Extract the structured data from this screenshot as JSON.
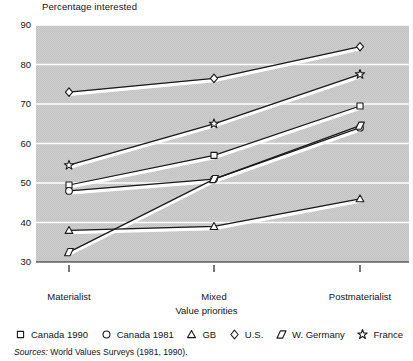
{
  "chart_data": {
    "type": "line",
    "title": "Percentage interested",
    "ylabel": "Percentage interested",
    "xlabel": "Value priorities",
    "categories": [
      "Materialist",
      "Mixed",
      "Postmaterialist"
    ],
    "ylim": [
      30,
      90
    ],
    "yticks": [
      30,
      40,
      50,
      60,
      70,
      80,
      90
    ],
    "grid": true,
    "legend_position": "bottom",
    "series": [
      {
        "name": "Canada 1990",
        "marker": "square",
        "values": [
          49.5,
          57.0,
          69.5
        ]
      },
      {
        "name": "Canada 1981",
        "marker": "circle",
        "values": [
          48.0,
          51.0,
          64.0
        ]
      },
      {
        "name": "GB",
        "marker": "triangle",
        "values": [
          38.0,
          39.0,
          46.0
        ]
      },
      {
        "name": "U.S.",
        "marker": "diamond",
        "values": [
          73.0,
          76.5,
          84.5
        ]
      },
      {
        "name": "W. Germany",
        "marker": "parallelogram",
        "values": [
          32.5,
          51.0,
          64.5
        ]
      },
      {
        "name": "France",
        "marker": "star",
        "values": [
          54.5,
          65.0,
          77.5
        ]
      }
    ]
  },
  "axis": {
    "y_title": "Percentage interested",
    "x_title": "Value priorities",
    "yticks": [
      "90",
      "80",
      "70",
      "60",
      "50",
      "40",
      "30"
    ],
    "xticks": [
      "Materialist",
      "Mixed",
      "Postmaterialist"
    ]
  },
  "legend": {
    "items": [
      {
        "label": "Canada 1990",
        "marker": "square-marker-icon"
      },
      {
        "label": "Canada 1981",
        "marker": "circle-marker-icon"
      },
      {
        "label": "GB",
        "marker": "triangle-marker-icon"
      },
      {
        "label": "U.S.",
        "marker": "diamond-marker-icon"
      },
      {
        "label": "W. Germany",
        "marker": "parallelogram-marker-icon"
      },
      {
        "label": "France",
        "marker": "star-marker-icon"
      }
    ]
  },
  "footer": {
    "sources_label": "Sources:",
    "sources_text": "World Values Surveys (1981, 1990)."
  },
  "colors": {
    "plot_background": "#c9c9c9",
    "gridline": "#ffffff",
    "line": "#1a1a1a",
    "marker_fill": "#ffffff",
    "text": "#141414"
  }
}
